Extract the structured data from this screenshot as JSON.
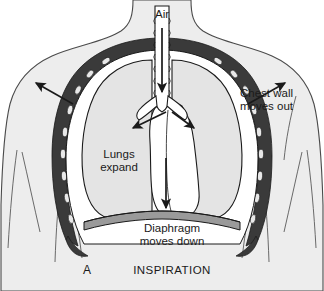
{
  "figure": {
    "panel_letter": "A",
    "caption": "INSPIRATION",
    "labels": {
      "air": "Air",
      "chest_wall_line1": "Chest wall",
      "chest_wall_line2": "moves out",
      "lungs_line1": "Lungs",
      "lungs_line2": "expand",
      "diaphragm_line1": "Diaphragm",
      "diaphragm_line2": "moves down"
    },
    "anatomy": {
      "torso": "torso-silhouette",
      "ribcage": "ribcage-band",
      "left_lung": "left-lung",
      "right_lung": "right-lung",
      "trachea": "trachea",
      "bronchi": "bronchi",
      "heart": "heart-mediastinum",
      "diaphragm": "diaphragm-band"
    },
    "arrows": [
      {
        "name": "air-inflow-arrow",
        "direction": "down"
      },
      {
        "name": "bronchus-left-arrow",
        "direction": "down-left"
      },
      {
        "name": "bronchus-right-arrow",
        "direction": "down-right"
      },
      {
        "name": "chest-wall-left-arrow",
        "direction": "up-left"
      },
      {
        "name": "chest-wall-right-arrow",
        "direction": "up-right"
      },
      {
        "name": "diaphragm-down-arrow",
        "direction": "down"
      }
    ],
    "colors": {
      "background": "#ffffff",
      "torso_fill": "#ededed",
      "lung_fill": "#e4e4e4",
      "ribcage_dark": "#3a3a3a",
      "diaphragm_fill": "#9a9a9a",
      "outline": "#1a1a1a",
      "text": "#1a1a1a"
    }
  }
}
